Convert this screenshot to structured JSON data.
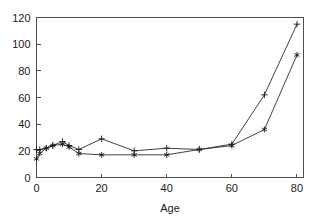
{
  "chart_data": {
    "type": "line",
    "title": "",
    "xlabel": "Age",
    "ylabel": "",
    "xlim": [
      0,
      82
    ],
    "ylim": [
      0,
      120
    ],
    "xticks": [
      0,
      20,
      40,
      60,
      80
    ],
    "yticks": [
      0,
      20,
      40,
      60,
      80,
      100,
      120
    ],
    "xtick_labels": [
      "0",
      "20",
      "40",
      "60",
      "80"
    ],
    "ytick_labels": [
      "0",
      "20",
      "40",
      "60",
      "80",
      "100",
      "120"
    ],
    "grid": false,
    "legend": "none",
    "x": [
      0,
      1,
      3,
      5,
      8,
      10,
      13,
      20,
      30,
      40,
      50,
      60,
      70,
      80
    ],
    "series": [
      {
        "name": "series-plus",
        "marker": "plus",
        "values": [
          21,
          21,
          22,
          24,
          27,
          24,
          21,
          29,
          20,
          22,
          21,
          25,
          62,
          115
        ]
      },
      {
        "name": "series-star",
        "marker": "star",
        "values": [
          14,
          18,
          22,
          24,
          25,
          23,
          18,
          17,
          17,
          17,
          21,
          24,
          36,
          92
        ]
      }
    ],
    "colors": {
      "line": "#2b2b2b",
      "axis": "#4d4d4d",
      "text": "#1a1a1a",
      "background": "#ffffff"
    }
  }
}
